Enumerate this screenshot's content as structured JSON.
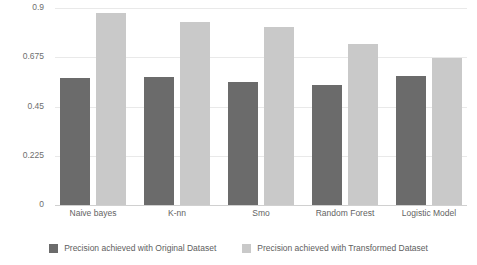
{
  "chart_data": {
    "type": "bar",
    "title": "",
    "subtitle": "",
    "xlabel": "",
    "ylabel": "",
    "categories": [
      "Naive bayes",
      "K-nn",
      "Smo",
      "Random Forest",
      "Logistic Model"
    ],
    "series": [
      {
        "name": "Precision achieved with Original Dataset",
        "color": "#6b6b6b",
        "values": [
          0.58,
          0.586,
          0.563,
          0.549,
          0.591
        ]
      },
      {
        "name": "Precision achieved with Transformed Dataset",
        "color": "#c9c9c9",
        "values": [
          0.877,
          0.837,
          0.814,
          0.735,
          0.67
        ]
      }
    ],
    "ylim": [
      0,
      0.9
    ],
    "yticks": [
      0,
      0.225,
      0.45,
      0.675,
      0.9
    ],
    "ytick_labels": [
      "0",
      "0.225",
      "0.45",
      "0.675",
      "0.9"
    ],
    "grid": true,
    "legend_position": "bottom-center",
    "background_color": "#ffffff",
    "grid_color": "#e9e9e9",
    "axis_color": "#d0d0d0",
    "text_color": "#5e5e5e"
  }
}
